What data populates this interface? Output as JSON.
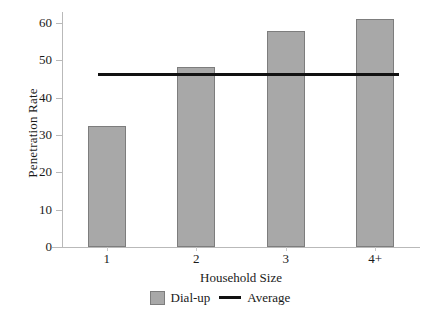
{
  "chart_data": {
    "type": "bar",
    "title": "",
    "subtitle": "",
    "categories": [
      "1",
      "2",
      "3",
      "4+"
    ],
    "values": [
      32.5,
      48.3,
      58.0,
      61.2
    ],
    "series": [
      {
        "name": "Dial-up",
        "values": [
          32.5,
          48.3,
          58.0,
          61.2
        ],
        "color": "#a8a8a8"
      }
    ],
    "reference_line": {
      "name": "Average",
      "value": 46.3,
      "color": "#111111",
      "orientation": "horizontal"
    },
    "xlabel": "Household Size",
    "ylabel": "Penetration Rate",
    "ylim": [
      0,
      63
    ],
    "yticks": [
      0,
      10,
      20,
      30,
      40,
      50,
      60
    ],
    "ytick_labels": [
      "0",
      "10",
      "20",
      "30",
      "40",
      "50",
      "60"
    ],
    "xtick_labels": [
      "1",
      "2",
      "3",
      "4+"
    ],
    "grid": false,
    "legend_position": "bottom",
    "legend": [
      {
        "label": "Dial-up",
        "marker": "square",
        "color": "#a8a8a8"
      },
      {
        "label": "Average",
        "marker": "line",
        "color": "#111111"
      }
    ]
  },
  "axes": {
    "y_title": "Penetration Rate",
    "x_title": "Household Size"
  },
  "legend": {
    "items": [
      {
        "label": "Dial-up"
      },
      {
        "label": "Average"
      }
    ]
  },
  "colors": {
    "bar_fill": "#a8a8a8",
    "bar_stroke": "#7d7d7d",
    "average_line": "#111111",
    "axis": "#b9b9b9",
    "text": "#1a1a1a",
    "background": "#ffffff"
  }
}
